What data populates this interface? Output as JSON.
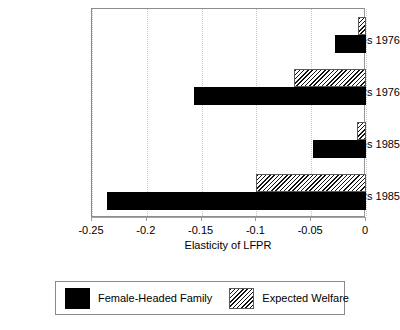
{
  "chart_data": {
    "type": "bar",
    "orientation": "horizontal",
    "title": "",
    "subtitle": "",
    "xlabel": "Elasticity of LFPR",
    "ylabel": "",
    "xlim": [
      -0.25,
      0
    ],
    "xticks": [
      -0.25,
      -0.2,
      -0.15,
      -0.1,
      -0.05,
      0
    ],
    "xticklabels": [
      "-0.25",
      "-0.2",
      "-0.15",
      "-0.1",
      "-0.05",
      "0"
    ],
    "categories": [
      "Whites 1976",
      "Blacks 1976",
      "Whites 1985",
      "Blacks 1985"
    ],
    "series": [
      {
        "name": "Female-Headed Family",
        "color": "#000000",
        "fill": "solid",
        "values": [
          -0.028,
          -0.157,
          -0.048,
          -0.236
        ]
      },
      {
        "name": "Expected Welfare",
        "color": "#111111",
        "fill": "diagonal-hatch",
        "values": [
          -0.007,
          -0.066,
          -0.008,
          -0.1
        ]
      }
    ],
    "grid": true,
    "grid_axis": "x",
    "grid_style": "dotted",
    "legend_position": "bottom-outside",
    "legend_entries": [
      "Female-Headed Family",
      "Expected Welfare"
    ]
  },
  "axis": {
    "x_title": "Elasticity of LFPR",
    "tick_labels": [
      "-0.25",
      "-0.2",
      "-0.15",
      "-0.1",
      "-0.05",
      "0"
    ]
  },
  "y_categories": [
    {
      "label": "Whites 1976"
    },
    {
      "label": "Blacks 1976"
    },
    {
      "label": "Whites 1985"
    },
    {
      "label": "Blacks 1985"
    }
  ],
  "legend": {
    "items": [
      {
        "label": "Female-Headed Family",
        "swatch": "solid-black-swatch"
      },
      {
        "label": "Expected Welfare",
        "swatch": "hatched-swatch"
      }
    ]
  }
}
